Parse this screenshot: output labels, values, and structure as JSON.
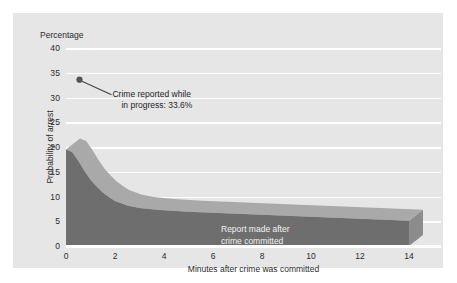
{
  "chart_data": {
    "type": "area",
    "title": "",
    "subtitle": "",
    "unit_label": "Percentage",
    "xlabel": "Minutes after crime was committed",
    "ylabel": "Probability of arrest",
    "xlim": [
      0,
      14
    ],
    "ylim": [
      0,
      40
    ],
    "xticks": [
      "0",
      "2",
      "4",
      "6",
      "8",
      "10",
      "12",
      "14"
    ],
    "xtick_values": [
      0,
      2,
      4,
      6,
      8,
      10,
      12,
      14
    ],
    "yticks": [
      "0",
      "5",
      "10",
      "15",
      "20",
      "25",
      "30",
      "35",
      "40"
    ],
    "ytick_values": [
      0,
      5,
      10,
      15,
      20,
      25,
      30,
      35,
      40
    ],
    "grid": "horizontal-white",
    "legend": "none",
    "series": [
      {
        "name": "Report made after crime committed",
        "x": [
          0,
          0.25,
          0.5,
          0.75,
          1,
          1.25,
          1.5,
          1.75,
          2,
          2.5,
          3,
          3.5,
          4,
          5,
          6,
          7,
          8,
          9,
          10,
          11,
          12,
          13,
          14
        ],
        "values": [
          19.5,
          19.0,
          17.2,
          15.2,
          13.4,
          12.0,
          10.8,
          9.9,
          9.1,
          8.2,
          7.7,
          7.4,
          7.2,
          6.9,
          6.7,
          6.5,
          6.3,
          6.1,
          5.9,
          5.7,
          5.5,
          5.3,
          5.1
        ]
      }
    ],
    "annotations": [
      {
        "name": "crime-in-progress-point",
        "text_line1": "Crime reported while",
        "text_line2": "in progress: 33.6%",
        "value": 33.6,
        "x": 0.55,
        "marker": "filled-circle"
      },
      {
        "name": "series-inline-label",
        "text_line1": "Report made after",
        "text_line2": "crime committed"
      }
    ],
    "colors": {
      "panel_background": "#e6e6e6",
      "figure_background": "#ffffff",
      "gridline": "#ffffff",
      "area_front_face": "#6e6e6e",
      "area_top_face": "#a9a9a9",
      "area_side_face": "#8c8c8c",
      "marker": "#555555",
      "leader_line": "#444444",
      "tick_text": "#2b2b2b",
      "inline_label_text": "#f2f2f2"
    }
  },
  "labels": {
    "unit": "Percentage",
    "x_axis_title": "Minutes after crime was committed",
    "y_axis_title": "Probability of arrest",
    "annotation_line1": "Crime reported while",
    "annotation_line2": "in progress: 33.6%",
    "series_label_line1": "Report made after",
    "series_label_line2": "crime committed"
  }
}
